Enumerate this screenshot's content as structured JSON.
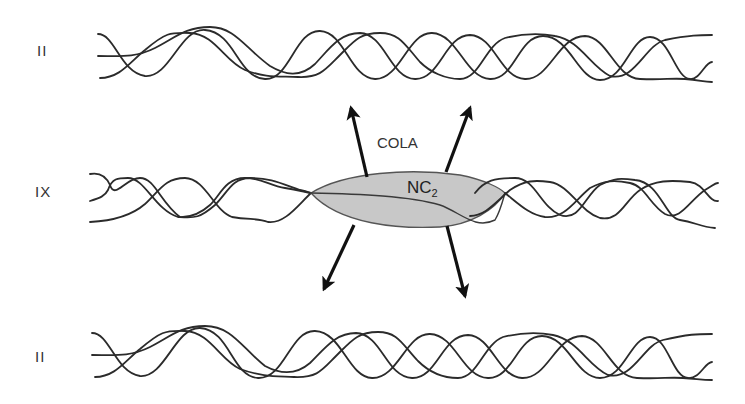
{
  "figure": {
    "rows": [
      {
        "label": "II",
        "type": "collagen-II-fibril"
      },
      {
        "label": "IX",
        "type": "collagen-IX"
      },
      {
        "label": "II",
        "type": "collagen-II-fibril"
      }
    ],
    "domain_labels": {
      "cola": "COLA",
      "nc2_main": "NC",
      "nc2_sub": "2"
    },
    "colors": {
      "strand": "#2b2b2b",
      "nc2_fill": "#c8c8c8",
      "nc2_stroke": "#555555",
      "arrow": "#111111"
    }
  }
}
